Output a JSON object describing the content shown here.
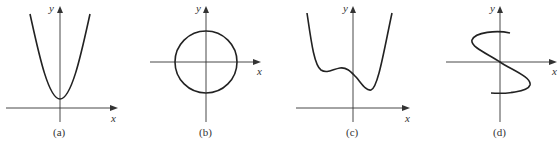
{
  "figure": {
    "panels": [
      {
        "id": "a",
        "caption": "(a)",
        "x_label": "x",
        "y_label": "y",
        "curve": "parabola opening upward, vertex above x-axis on y-axis"
      },
      {
        "id": "b",
        "caption": "(b)",
        "x_label": "x",
        "y_label": "y",
        "curve": "circle centered at origin"
      },
      {
        "id": "c",
        "caption": "(c)",
        "x_label": "x",
        "y_label": "y",
        "curve": "quartic-like curve with two local minima and one local maximum, above x-axis"
      },
      {
        "id": "d",
        "caption": "(d)",
        "x_label": "x",
        "y_label": "y",
        "curve": "S-shaped curve through origin (not a function of x)"
      }
    ]
  }
}
